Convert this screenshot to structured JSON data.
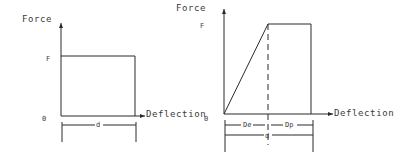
{
  "diagrams": [
    {
      "id": "rigid-plastic",
      "y_axis_label": "Force",
      "x_axis_label": "Deflection",
      "force_level_label": "F",
      "origin_label": "0",
      "dimensions": [
        {
          "label": "d"
        }
      ]
    },
    {
      "id": "elastic-plastic",
      "y_axis_label": "Force",
      "x_axis_label": "Deflection",
      "force_level_label": "F",
      "origin_label": "0",
      "dimensions": [
        {
          "label": "De"
        },
        {
          "label": "Dp"
        },
        {
          "label": "d"
        }
      ]
    }
  ],
  "colors": {
    "line": "#2a2a2a",
    "text": "#3a3a3a",
    "background": "#ffffff"
  }
}
